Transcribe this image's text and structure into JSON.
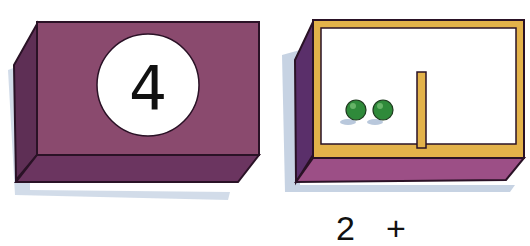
{
  "left_box": {
    "number": "4",
    "colors": {
      "front": "#8a4a6e",
      "side": "#5e2f55",
      "bottom": "#6b3560",
      "circle": "#ffffff",
      "shadow": "#c7d3e3"
    }
  },
  "right_box": {
    "peas": 2,
    "colors": {
      "frame": "#e3b24a",
      "inside": "#ffffff",
      "side": "#5a2f6a",
      "bottom": "#9c4f86",
      "pea": "#2f8a3a",
      "shadow": "#b9c8dc"
    }
  },
  "equation": {
    "first": "2",
    "operator": "+"
  }
}
